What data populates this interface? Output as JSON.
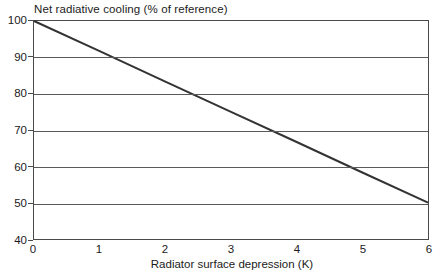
{
  "chart_data": {
    "type": "line",
    "title": "Net radiative cooling (% of reference)",
    "xlabel": "Radiator surface depression (K)",
    "ylabel": "Net radiative cooling (% of reference)",
    "xlim": [
      0,
      6
    ],
    "ylim": [
      40,
      100
    ],
    "xticks": [
      "0",
      "1",
      "2",
      "3",
      "4",
      "5",
      "6"
    ],
    "yticks": [
      "40",
      "50",
      "60",
      "70",
      "80",
      "90",
      "100"
    ],
    "grid": "horizontal",
    "legend": "none",
    "series": [
      {
        "name": "Net radiative cooling",
        "color": "#333333",
        "x": [
          0,
          1,
          2,
          3,
          4,
          5,
          6
        ],
        "values": [
          100,
          91.7,
          83.3,
          75,
          66.7,
          58.3,
          50
        ]
      }
    ],
    "annotations": []
  },
  "axes": {
    "y_tick_labels": [
      "100",
      "90",
      "80",
      "70",
      "60",
      "50",
      "40"
    ],
    "x_tick_labels": [
      "0",
      "1",
      "2",
      "3",
      "4",
      "5",
      "6"
    ]
  }
}
